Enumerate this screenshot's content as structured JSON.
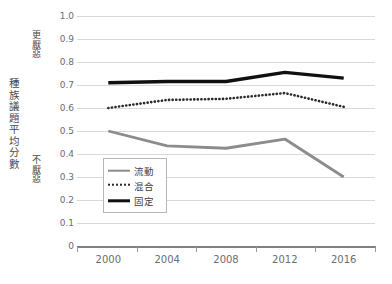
{
  "chart_data": {
    "type": "line",
    "title": "",
    "xlabel": "",
    "ylabel": "種族議題平均分數",
    "categories": [
      "2000",
      "2004",
      "2008",
      "2012",
      "2016"
    ],
    "x": [
      2000,
      2004,
      2008,
      2012,
      2016
    ],
    "ylim": [
      0,
      1.0
    ],
    "ytick_step": 0.1,
    "grid": true,
    "legend_position": "inside-lower-left",
    "series": [
      {
        "name": "流動",
        "style": "solid-gray",
        "color": "#8c8c8c",
        "values": [
          0.5,
          0.435,
          0.425,
          0.465,
          0.3
        ]
      },
      {
        "name": "混合",
        "style": "dotted-black",
        "color": "#2b2b2b",
        "values": [
          0.6,
          0.635,
          0.64,
          0.665,
          0.605
        ]
      },
      {
        "name": "固定",
        "style": "solid-black",
        "color": "#101010",
        "values": [
          0.71,
          0.715,
          0.715,
          0.755,
          0.73
        ]
      }
    ],
    "yticks": [
      "1.0",
      "0.9",
      "0.8",
      "0.7",
      "0.6",
      "0.5",
      "0.4",
      "0.3",
      "0.2",
      "0.1",
      "0"
    ],
    "annotations": [
      {
        "name": "more-averse",
        "text": "更厭惡",
        "position": "upper-left-outside"
      },
      {
        "name": "not-averse",
        "text": "不厭惡",
        "position": "lower-left-outside"
      }
    ]
  },
  "axes": {
    "y_title": "種族議題平均分數",
    "annotation_top": "更厭惡",
    "annotation_bottom": "不厭惡"
  },
  "legend": {
    "items": [
      {
        "label": "流動"
      },
      {
        "label": "混合"
      },
      {
        "label": "固定"
      }
    ]
  },
  "colors": {
    "gridline": "#d9d9d9",
    "axis": "#808080",
    "series_fluid": "#8c8c8c",
    "series_mixed": "#2b2b2b",
    "series_fixed": "#101010",
    "text": "#6d6d6d"
  }
}
